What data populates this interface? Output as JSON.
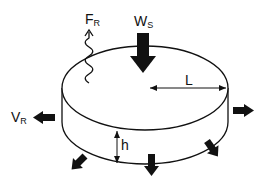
{
  "diagram": {
    "type": "physics-free-body-diagram",
    "colors": {
      "stroke": "#111111",
      "background": "#ffffff"
    },
    "labels": {
      "fr_main": "F",
      "fr_sub": "R",
      "ws_main": "W",
      "ws_sub": "S",
      "vr_main": "V",
      "vr_sub": "R",
      "radius": "L",
      "height": "h"
    },
    "arrows": [
      {
        "name": "weight-arrow",
        "direction": "down",
        "label": "W_S"
      },
      {
        "name": "force-arrow",
        "direction": "up",
        "style": "wavy",
        "label": "F_R"
      },
      {
        "name": "velocity-arrow-left",
        "direction": "left",
        "label": "V_R"
      },
      {
        "name": "velocity-arrow-right",
        "direction": "right"
      },
      {
        "name": "velocity-arrow-bottom-left",
        "direction": "down-left"
      },
      {
        "name": "velocity-arrow-bottom",
        "direction": "down"
      },
      {
        "name": "velocity-arrow-bottom-right",
        "direction": "down-right"
      }
    ],
    "dimensions": [
      {
        "name": "radius-dimension",
        "label": "L"
      },
      {
        "name": "height-dimension",
        "label": "h"
      }
    ]
  }
}
